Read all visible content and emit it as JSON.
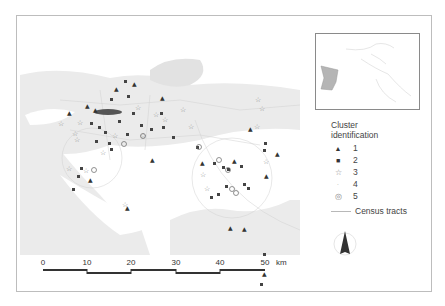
{
  "map": {
    "title": "Cluster map",
    "background_land": "#ececec",
    "water": "#ffffff"
  },
  "legend": {
    "title_line1": "Cluster",
    "title_line2": "identification",
    "items": [
      {
        "id": "1",
        "symbol": "▲",
        "label": "1"
      },
      {
        "id": "2",
        "symbol": "■",
        "label": "2"
      },
      {
        "id": "3",
        "symbol": "☆",
        "label": "3"
      },
      {
        "id": "4",
        "symbol": "·",
        "label": "4"
      },
      {
        "id": "5",
        "symbol": "◎",
        "label": "5"
      }
    ],
    "census_tracts_label": "Census tracts"
  },
  "scale_bar": {
    "ticks": [
      "0",
      "10",
      "20",
      "30",
      "40",
      "50"
    ],
    "unit": "km"
  },
  "north_arrow": {
    "icon": "north-arrow-icon"
  },
  "inset": {
    "description": "locator map",
    "highlight_color": "#b5b5b5"
  }
}
